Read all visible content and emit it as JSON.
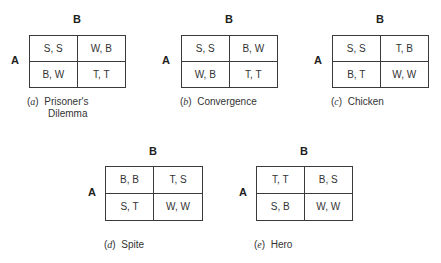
{
  "figure": {
    "row_player": "A",
    "column_player": "B",
    "games": [
      {
        "id": "a",
        "letter": "a",
        "caption_line1": "Prisoner's",
        "caption_line2": "Dilemma",
        "cells": [
          "S, S",
          "W, B",
          "B, W",
          "T, T"
        ]
      },
      {
        "id": "b",
        "letter": "b",
        "caption_line1": "Convergence",
        "caption_line2": "",
        "cells": [
          "S, S",
          "B, W",
          "W, B",
          "T, T"
        ]
      },
      {
        "id": "c",
        "letter": "c",
        "caption_line1": "Chicken",
        "caption_line2": "",
        "cells": [
          "S, S",
          "T, B",
          "B, T",
          "W, W"
        ]
      },
      {
        "id": "d",
        "letter": "d",
        "caption_line1": "Spite",
        "caption_line2": "",
        "cells": [
          "B, B",
          "T, S",
          "S, T",
          "W, W"
        ]
      },
      {
        "id": "e",
        "letter": "e",
        "caption_line1": "Hero",
        "caption_line2": "",
        "cells": [
          "T, T",
          "B, S",
          "S, B",
          "W, W"
        ]
      }
    ]
  }
}
